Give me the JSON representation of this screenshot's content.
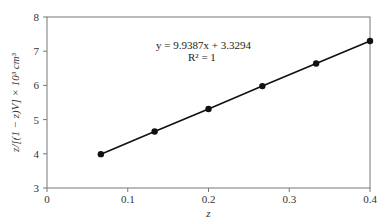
{
  "chart_data": {
    "type": "scatter",
    "title": "",
    "xlabel": "z",
    "ylabel": "z/[(1 − z)V] × 10³ cm³",
    "xlim": [
      0,
      0.4
    ],
    "ylim": [
      3,
      8
    ],
    "xticks": [
      0,
      0.1,
      0.2,
      0.3,
      0.4
    ],
    "xtick_labels": [
      "0",
      "0.1",
      "0.2",
      "0.3",
      "0.4"
    ],
    "yticks": [
      3,
      4,
      5,
      6,
      7,
      8
    ],
    "ytick_labels": [
      "3",
      "4",
      "5",
      "6",
      "7",
      "8"
    ],
    "grid": false,
    "series": [
      {
        "name": "data",
        "line": true,
        "marker": "circle",
        "color": "#111111",
        "x": [
          0.0667,
          0.1333,
          0.2,
          0.2667,
          0.3333,
          0.4
        ],
        "y": [
          3.99,
          4.65,
          5.31,
          5.98,
          6.64,
          7.3
        ]
      }
    ],
    "annotations": [
      {
        "text": "y = 9.9387x + 3.3294",
        "x": 0.135,
        "y": 7.05
      },
      {
        "text": "R² = 1",
        "x": 0.135,
        "y": 6.7
      }
    ]
  }
}
